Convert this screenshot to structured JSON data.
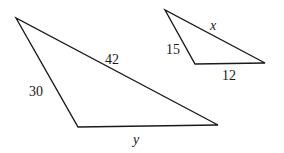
{
  "diagram": {
    "triangles": [
      {
        "id": "large",
        "vertices": [
          [
            16,
            18
          ],
          [
            78,
            127
          ],
          [
            218,
            125
          ]
        ],
        "sides": {
          "left": "30",
          "top": "42",
          "bottom": "y"
        }
      },
      {
        "id": "small",
        "vertices": [
          [
            165,
            10
          ],
          [
            195,
            64
          ],
          [
            265,
            63
          ]
        ],
        "sides": {
          "left": "15",
          "top": "x",
          "bottom": "12"
        }
      }
    ],
    "colors": {
      "stroke": "#1a1a1a",
      "background": "#ffffff"
    }
  }
}
